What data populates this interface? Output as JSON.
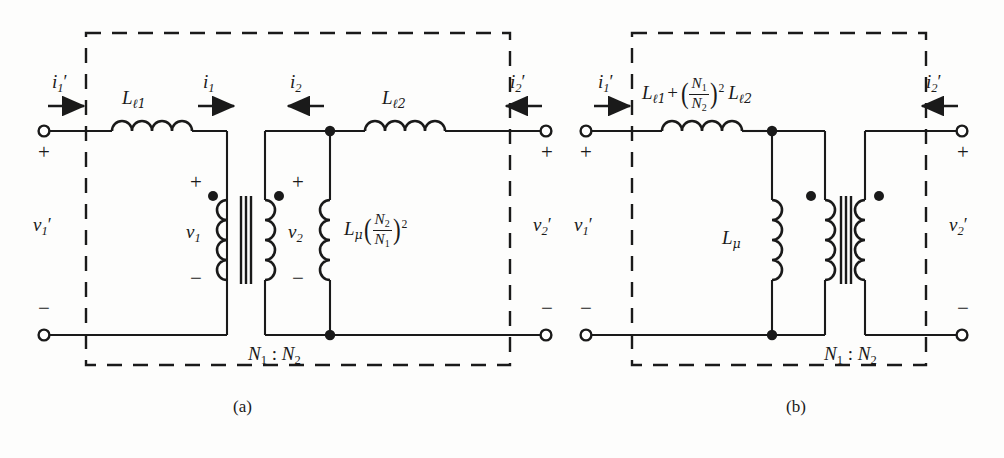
{
  "figure": {
    "background_color": "#fdfdfc",
    "line_color": "#1a1a1a"
  },
  "captions": {
    "left": "(a)",
    "right": "(b)"
  },
  "circuit_a": {
    "caption": "(a)",
    "labels": {
      "i1_prime": "i₁′",
      "i1": "i₁",
      "i2": "i₂",
      "i2_prime": "i₂′",
      "v1_prime": "v₁′",
      "v1": "v₁",
      "v2": "v₂",
      "v2_prime": "v₂′",
      "L_leak1": "Lℓ₁",
      "L_leak2": "Lℓ₂",
      "L_mag": "Lμ(N₂/N₁)²",
      "turns_ratio": "N₁ : N₂",
      "plus_left": "+",
      "minus_left": "−",
      "plus_v1": "+",
      "minus_v1": "−",
      "plus_v2": "+",
      "minus_v2": "−",
      "plus_right": "+",
      "minus_right": "−"
    },
    "parts": {
      "L_mu_base": "L",
      "L_mu_sub": "μ",
      "N2": "N",
      "N2_sub": "2",
      "N1": "N",
      "N1_sub": "1",
      "exponent": "2",
      "N_ratio_left": "N",
      "N_ratio_left_sub": "1",
      "colon": ":",
      "N_ratio_right": "N",
      "N_ratio_right_sub": "2"
    },
    "elements": [
      {
        "name": "input-terminal-top",
        "type": "terminal"
      },
      {
        "name": "input-terminal-bottom",
        "type": "terminal"
      },
      {
        "name": "leakage-inductor-primary",
        "type": "inductor"
      },
      {
        "name": "ideal-transformer",
        "type": "transformer"
      },
      {
        "name": "magnetizing-inductor",
        "type": "inductor"
      },
      {
        "name": "leakage-inductor-secondary",
        "type": "inductor"
      },
      {
        "name": "output-terminal-top",
        "type": "terminal"
      },
      {
        "name": "output-terminal-bottom",
        "type": "terminal"
      },
      {
        "name": "dashed-boundary-box",
        "type": "boundary"
      }
    ]
  },
  "circuit_b": {
    "caption": "(b)",
    "labels": {
      "i1_prime": "i₁′",
      "i2_prime": "i₂′",
      "v1_prime": "v₁′",
      "v2_prime": "v₂′",
      "L_total": "Lℓ₁ + (N₁/N₂)² Lℓ₂",
      "L_mag": "Lμ",
      "turns_ratio": "N₁ : N₂",
      "plus_left": "+",
      "minus_left": "−",
      "plus_right": "+",
      "minus_right": "−"
    },
    "parts": {
      "L_base": "L",
      "L_leak1_sub": "ℓ1",
      "plus_op": "+",
      "N1": "N",
      "N1_sub": "1",
      "N2": "N",
      "N2_sub": "2",
      "exponent": "2",
      "L_leak2_sub": "ℓ2",
      "L_mu_base": "L",
      "L_mu_sub": "μ",
      "N_ratio_left": "N",
      "N_ratio_left_sub": "1",
      "colon": ":",
      "N_ratio_right": "N",
      "N_ratio_right_sub": "2"
    },
    "elements": [
      {
        "name": "input-terminal-top",
        "type": "terminal"
      },
      {
        "name": "input-terminal-bottom",
        "type": "terminal"
      },
      {
        "name": "combined-leakage-inductor",
        "type": "inductor"
      },
      {
        "name": "magnetizing-inductor",
        "type": "inductor"
      },
      {
        "name": "ideal-transformer",
        "type": "transformer"
      },
      {
        "name": "output-terminal-top",
        "type": "terminal"
      },
      {
        "name": "output-terminal-bottom",
        "type": "terminal"
      },
      {
        "name": "dashed-boundary-box",
        "type": "boundary"
      }
    ]
  }
}
